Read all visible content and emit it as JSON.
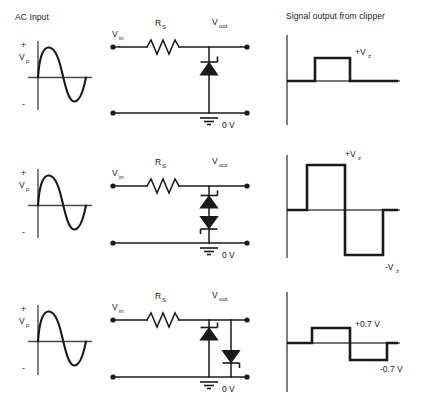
{
  "headers": {
    "left": "AC Input",
    "right": "Signal output from clipper"
  },
  "input_graph": {
    "peak_label": "V",
    "peak_sub": "p",
    "plus": "+",
    "minus": "-",
    "waveform": "sine"
  },
  "circuit_labels": {
    "vin": "V",
    "vin_sub": "in",
    "vout": "V",
    "vout_sub": "out",
    "rs": "R",
    "rs_sub": "S",
    "ground": "0 V"
  },
  "rows": [
    {
      "id": "row-single-zener",
      "circuit": {
        "name": "single-shunt-zener-clipper",
        "diode_count": 1,
        "diodes": [
          {
            "name": "zener-diode-1",
            "orientation": "cathode-up",
            "branch": "center"
          }
        ]
      },
      "output": {
        "name": "output-waveform-positive-clip",
        "upper_label": "+V",
        "upper_label_sub": "z",
        "lower_label": "",
        "lower_label_sub": "",
        "clip_positive": true,
        "clip_negative": false
      }
    },
    {
      "id": "row-back-to-back-zener",
      "circuit": {
        "name": "back-to-back-zener-clipper",
        "diode_count": 2,
        "diodes": [
          {
            "name": "zener-diode-1",
            "orientation": "cathode-up",
            "branch": "center"
          },
          {
            "name": "zener-diode-2",
            "orientation": "cathode-down",
            "branch": "center"
          }
        ]
      },
      "output": {
        "name": "output-waveform-symmetric-clip",
        "upper_label": "+V",
        "upper_label_sub": "z",
        "lower_label": "-V",
        "lower_label_sub": "z",
        "clip_positive": true,
        "clip_negative": true
      }
    },
    {
      "id": "row-parallel-zener-diode",
      "circuit": {
        "name": "parallel-zener-and-diode-clipper",
        "diode_count": 2,
        "diodes": [
          {
            "name": "zener-diode-1",
            "orientation": "cathode-up",
            "branch": "center"
          },
          {
            "name": "zener-diode-2",
            "orientation": "cathode-down",
            "branch": "right"
          }
        ]
      },
      "output": {
        "name": "output-waveform-diode-drop-clip",
        "upper_label": "+0.7 V",
        "upper_label_sub": "",
        "lower_label": "-0.7 V",
        "lower_label_sub": "",
        "clip_positive": true,
        "clip_negative": true
      }
    }
  ],
  "colors": {
    "ink": "#1a1a1a",
    "background": "#ffffff"
  }
}
